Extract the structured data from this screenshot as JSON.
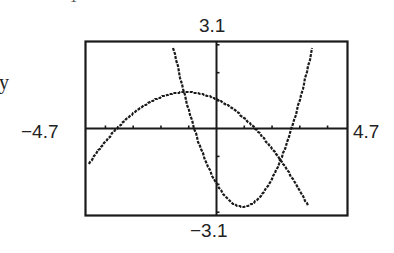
{
  "figure": {
    "labels": {
      "ymax": "3.1",
      "ymin": "−3.1",
      "xmin": "−4.7",
      "xmax": "4.7",
      "side_text": "y",
      "top_fragment": "1"
    },
    "colors": {
      "frame": "#1a1a1a",
      "curve": "#1a1a1a",
      "background": "#ffffff"
    }
  },
  "chart_data": {
    "type": "line",
    "title": "",
    "xlabel": "",
    "ylabel": "",
    "xlim": [
      -4.7,
      4.7
    ],
    "ylim": [
      -3.1,
      3.1
    ],
    "xscale_ticks": 1,
    "yscale_ticks": 1,
    "grid": false,
    "window_labels": {
      "xmin": "-4.7",
      "xmax": "4.7",
      "ymin": "-3.1",
      "ymax": "3.1"
    },
    "series": [
      {
        "name": "downward parabola",
        "form": "y = -0.21(x + 1.1)^2 + 1.3",
        "x": [
          -4.6,
          -3.7,
          -3.0,
          -2.0,
          -1.1,
          0.0,
          1.0,
          1.8,
          2.5,
          3.3
        ],
        "y": [
          -1.27,
          -0.12,
          0.54,
          1.13,
          1.3,
          1.05,
          0.37,
          -0.47,
          -1.13,
          -2.6
        ]
      },
      {
        "name": "upward parabola",
        "form": "y = 0.91(x - 0.95)^2 - 2.8",
        "x": [
          -1.55,
          -1.0,
          -0.65,
          0.0,
          0.95,
          2.0,
          2.6,
          3.0,
          3.45
        ],
        "y": [
          2.89,
          0.66,
          -0.47,
          -1.8,
          -2.8,
          -1.8,
          -0.32,
          1.02,
          2.89
        ]
      }
    ],
    "annotations": [
      "3.1",
      "-3.1",
      "-4.7",
      "4.7"
    ]
  }
}
